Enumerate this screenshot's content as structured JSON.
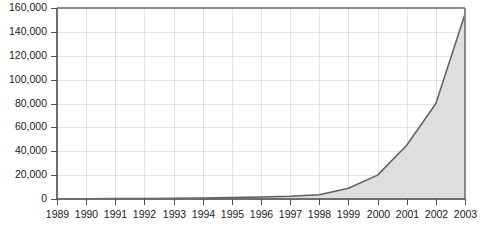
{
  "chart_data": {
    "type": "area",
    "title": "",
    "subtitle": "",
    "xlabel": "",
    "ylabel": "",
    "x": [
      1989,
      1990,
      1991,
      1992,
      1993,
      1994,
      1995,
      1996,
      1997,
      1998,
      1999,
      2000,
      2001,
      2002,
      2003
    ],
    "categories": [
      "1989",
      "1990",
      "1991",
      "1992",
      "1993",
      "1994",
      "1995",
      "1996",
      "1997",
      "1998",
      "1999",
      "2000",
      "2001",
      "2002",
      "2003"
    ],
    "values": [
      200,
      300,
      400,
      500,
      700,
      900,
      1200,
      1600,
      2200,
      3500,
      9000,
      20000,
      45000,
      80000,
      155000
    ],
    "series": [
      {
        "name": "Total",
        "values": [
          200,
          300,
          400,
          500,
          700,
          900,
          1200,
          1600,
          2200,
          3500,
          9000,
          20000,
          45000,
          80000,
          155000
        ]
      }
    ],
    "ylim": [
      0,
      160000
    ],
    "xlim": [
      1989,
      2003
    ],
    "ytick_values": [
      0,
      20000,
      40000,
      60000,
      80000,
      100000,
      120000,
      140000,
      160000
    ],
    "ytick_labels": [
      "0",
      "20,000",
      "40,000",
      "60,000",
      "80,000",
      "100,000",
      "120,000",
      "140,000",
      "160,000"
    ],
    "xtick_labels": [
      "1989",
      "1990",
      "1991",
      "1992",
      "1993",
      "1994",
      "1995",
      "1996",
      "1997",
      "1998",
      "1999",
      "2000",
      "2001",
      "2002",
      "2003"
    ],
    "grid": true,
    "legend": false,
    "legend_position": "none",
    "annotations": [],
    "colors": {
      "area_fill": "#dedede",
      "line": "#5f5f5f",
      "grid": "#e3e3e3",
      "frame": "#8a8a8a",
      "axis": "#6e6e6e",
      "text": "#1a1a1a",
      "background": "#ffffff"
    }
  }
}
